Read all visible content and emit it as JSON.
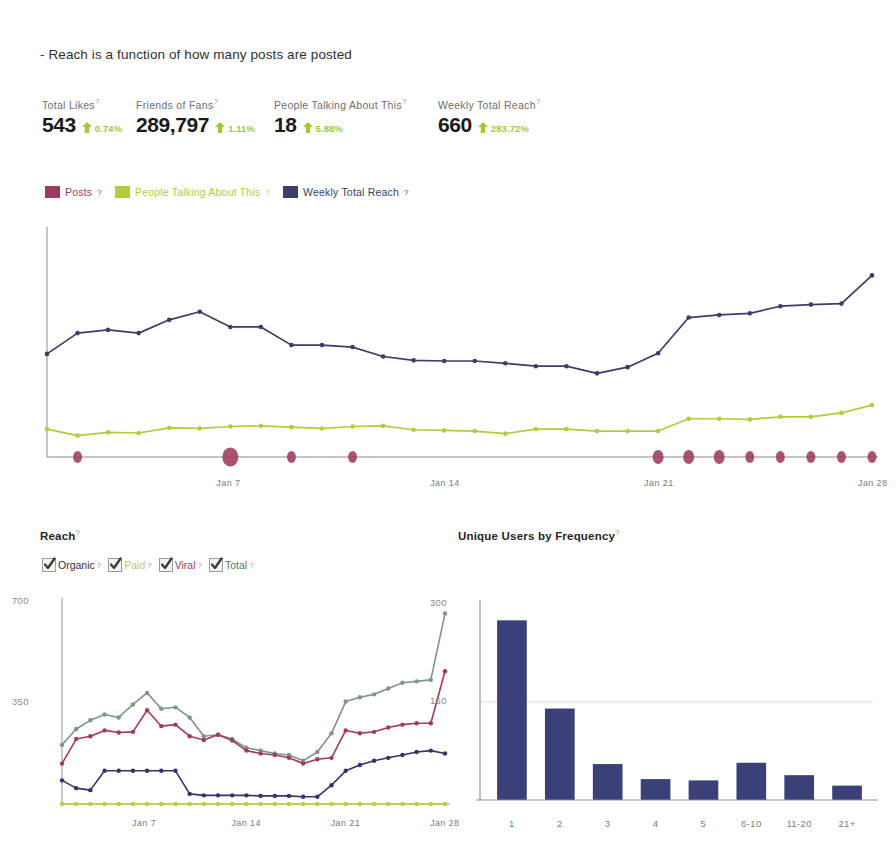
{
  "note": "- Reach is a function of how many posts are posted",
  "colors": {
    "posts": "#9e3a61",
    "people_talking": "#b2cc3b",
    "weekly_reach": "#3b3d6b",
    "reach_organic": "#32356b",
    "reach_paid": "#b9cf3c",
    "reach_viral": "#a33a5c",
    "reach_total": "#7d9780",
    "delta_green": "#9ec93a",
    "bar_navy": "#3c4079",
    "axis": "#8c8c8c"
  },
  "kpis": [
    {
      "label": "Total Likes",
      "value": "543",
      "delta": "0.74%",
      "direction": "up",
      "x": 0
    },
    {
      "label": "Friends of Fans",
      "value": "289,797",
      "delta": "1.11%",
      "direction": "up",
      "x": 94
    },
    {
      "label": "People Talking About This",
      "value": "18",
      "delta": "5.88%",
      "direction": "up",
      "x": 232
    },
    {
      "label": "Weekly Total Reach",
      "value": "660",
      "delta": "283.72%",
      "direction": "up",
      "x": 396
    }
  ],
  "legend": [
    {
      "label": "Posts",
      "color": "#9e3a61",
      "text_color": "#9e3a61"
    },
    {
      "label": "People Talking About This",
      "color": "#b2cc3b",
      "text_color": "#b2cc3b"
    },
    {
      "label": "Weekly Total Reach",
      "color": "#3b3d6b",
      "text_color": "#3b3d6b"
    }
  ],
  "reach_section": {
    "title": "Reach",
    "checkboxes": [
      {
        "label": "Organic",
        "checked": true,
        "color": "#333333"
      },
      {
        "label": "Paid",
        "checked": true,
        "color": "#b9cf3c"
      },
      {
        "label": "Viral",
        "checked": true,
        "color": "#a33a5c"
      },
      {
        "label": "Total",
        "checked": true,
        "color": "#5d7460"
      }
    ]
  },
  "frequency_section": {
    "title": "Unique Users by Frequency"
  },
  "chart_data": [
    {
      "id": "overview",
      "type": "line",
      "title": "",
      "xlabel": "",
      "ylabel": "",
      "grid": false,
      "legend_position": "top-left",
      "x": [
        "Jan 1",
        "Jan 2",
        "Jan 3",
        "Jan 4",
        "Jan 5",
        "Jan 6",
        "Jan 7",
        "Jan 8",
        "Jan 9",
        "Jan 10",
        "Jan 11",
        "Jan 12",
        "Jan 13",
        "Jan 14",
        "Jan 15",
        "Jan 16",
        "Jan 17",
        "Jan 18",
        "Jan 19",
        "Jan 20",
        "Jan 21",
        "Jan 22",
        "Jan 23",
        "Jan 24",
        "Jan 25",
        "Jan 26",
        "Jan 27",
        "Jan 28"
      ],
      "tick_labels": [
        "Jan 7",
        "Jan 14",
        "Jan 21",
        "Jan 28"
      ],
      "tick_indices": [
        6,
        13,
        20,
        27
      ],
      "ylim": [
        0,
        700
      ],
      "series": [
        {
          "name": "Weekly Total Reach",
          "color": "#3b3d6b",
          "values": [
            318,
            382,
            392,
            382,
            423,
            448,
            401,
            401,
            345,
            345,
            339,
            310,
            298,
            296,
            296,
            289,
            280,
            280,
            258,
            277,
            320,
            430,
            438,
            443,
            465,
            470,
            473,
            560
          ]
        },
        {
          "name": "People Talking About This",
          "color": "#b2cc3b",
          "values": [
            86,
            66,
            76,
            74,
            90,
            88,
            94,
            96,
            92,
            88,
            94,
            96,
            84,
            82,
            80,
            72,
            86,
            86,
            80,
            80,
            80,
            118,
            118,
            116,
            124,
            124,
            136,
            160
          ]
        }
      ],
      "bubbles": {
        "name": "Posts",
        "color": "#9e3a61",
        "points": [
          {
            "index": 1,
            "size": 9
          },
          {
            "index": 6,
            "size": 16
          },
          {
            "index": 8,
            "size": 9
          },
          {
            "index": 10,
            "size": 9
          },
          {
            "index": 20,
            "size": 11
          },
          {
            "index": 21,
            "size": 11
          },
          {
            "index": 22,
            "size": 11
          },
          {
            "index": 23,
            "size": 9
          },
          {
            "index": 24,
            "size": 9
          },
          {
            "index": 25,
            "size": 9
          },
          {
            "index": 26,
            "size": 9
          },
          {
            "index": 27,
            "size": 9
          }
        ]
      }
    },
    {
      "id": "reach",
      "type": "line",
      "title": "Reach",
      "xlabel": "",
      "ylabel": "",
      "grid": false,
      "ylim": [
        0,
        700
      ],
      "ytick_labels": [
        "700",
        "350"
      ],
      "ytick_values": [
        700,
        350
      ],
      "x": [
        "Jan 1",
        "Jan 2",
        "Jan 3",
        "Jan 4",
        "Jan 5",
        "Jan 6",
        "Jan 7",
        "Jan 8",
        "Jan 9",
        "Jan 10",
        "Jan 11",
        "Jan 12",
        "Jan 13",
        "Jan 14",
        "Jan 15",
        "Jan 16",
        "Jan 17",
        "Jan 18",
        "Jan 19",
        "Jan 20",
        "Jan 21",
        "Jan 22",
        "Jan 23",
        "Jan 24",
        "Jan 25",
        "Jan 26",
        "Jan 27",
        "Jan 28"
      ],
      "tick_labels": [
        "Jan 7",
        "Jan 14",
        "Jan 21",
        "Jan 28"
      ],
      "tick_indices": [
        6,
        13,
        20,
        27
      ],
      "series": [
        {
          "name": "Total",
          "color": "#7d9780",
          "values": [
            205,
            260,
            290,
            310,
            300,
            345,
            385,
            330,
            335,
            300,
            235,
            240,
            225,
            195,
            185,
            175,
            170,
            150,
            180,
            245,
            355,
            370,
            380,
            400,
            420,
            425,
            430,
            660
          ]
        },
        {
          "name": "Viral",
          "color": "#a33a5c",
          "values": [
            140,
            225,
            235,
            255,
            248,
            250,
            325,
            270,
            275,
            235,
            222,
            240,
            220,
            185,
            175,
            170,
            160,
            140,
            155,
            160,
            255,
            245,
            250,
            265,
            275,
            280,
            280,
            460
          ]
        },
        {
          "name": "Organic",
          "color": "#32356b",
          "values": [
            82,
            55,
            48,
            115,
            115,
            115,
            115,
            115,
            115,
            35,
            30,
            30,
            30,
            30,
            28,
            28,
            28,
            25,
            25,
            65,
            115,
            135,
            150,
            160,
            170,
            180,
            185,
            175
          ]
        },
        {
          "name": "Paid",
          "color": "#b9cf3c",
          "values": [
            0,
            0,
            0,
            0,
            0,
            0,
            0,
            0,
            0,
            0,
            0,
            0,
            0,
            0,
            0,
            0,
            0,
            0,
            0,
            0,
            0,
            0,
            0,
            0,
            0,
            0,
            0,
            0
          ]
        }
      ]
    },
    {
      "id": "unique-users-by-frequency",
      "type": "bar",
      "title": "Unique Users by Frequency",
      "xlabel": "",
      "ylabel": "",
      "grid": true,
      "categories": [
        "1",
        "2",
        "3",
        "4",
        "5",
        "6-10",
        "11-20",
        "21+"
      ],
      "values": [
        275,
        140,
        55,
        32,
        30,
        57,
        38,
        22
      ],
      "ylim": [
        0,
        300
      ],
      "ytick_labels": [
        "300",
        "150"
      ],
      "ytick_values": [
        300,
        150
      ],
      "bar_color": "#3c4079"
    }
  ]
}
